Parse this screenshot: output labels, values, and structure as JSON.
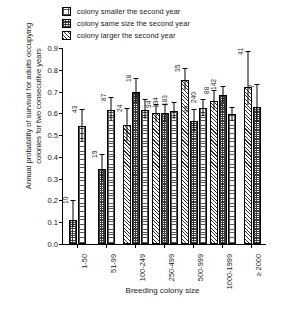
{
  "chart_data": {
    "type": "bar",
    "title": "",
    "xlabel": "Breeding colony size",
    "ylabel": "Annual probability of survival for adults occupying colonies for two consecutive years",
    "ylim": [
      0.0,
      0.9
    ],
    "yticks": [
      "0.0",
      "0.1",
      "0.2",
      "0.3",
      "0.4",
      "0.5",
      "0.6",
      "0.7",
      "0.8",
      "0.9"
    ],
    "categories": [
      "1-50",
      "51-99",
      "100-249",
      "250-499",
      "500-999",
      "1000-1999",
      "≥ 2000"
    ],
    "grid": false,
    "legend_position": "top",
    "series": [
      {
        "name": "colony smaller the second year",
        "pattern": "dots"
      },
      {
        "name": "colony same size the second year",
        "pattern": "dark"
      },
      {
        "name": "colony larger the second year",
        "pattern": "hatch"
      }
    ],
    "groups": [
      {
        "category": "1-50",
        "bars": [
          {
            "series": "colony same size the second year",
            "pattern": "dark",
            "value": 0.11,
            "err_low": 0.03,
            "err_high": 0.09,
            "n": "10"
          },
          {
            "series": "colony smaller the second year",
            "pattern": "dots",
            "value": 0.54,
            "err_low": 0.07,
            "err_high": 0.08,
            "n": "43"
          }
        ]
      },
      {
        "category": "51-99",
        "bars": [
          {
            "series": "colony same size the second year",
            "pattern": "dark",
            "value": 0.345,
            "err_low": 0.06,
            "err_high": 0.07,
            "n": "19"
          },
          {
            "series": "colony smaller the second year",
            "pattern": "dots",
            "value": 0.615,
            "err_low": 0.05,
            "err_high": 0.06,
            "n": "87"
          }
        ]
      },
      {
        "category": "100-249",
        "bars": [
          {
            "series": "colony larger the second year",
            "pattern": "hatch",
            "value": 0.545,
            "err_low": 0.07,
            "err_high": 0.08,
            "n": "24"
          },
          {
            "series": "colony same size the second year",
            "pattern": "dark",
            "value": 0.7,
            "err_low": 0.05,
            "err_high": 0.06,
            "n": "18"
          },
          {
            "series": "colony smaller the second year",
            "pattern": "dots",
            "value": 0.615,
            "err_low": 0.04,
            "err_high": 0.05,
            "n": "116"
          }
        ]
      },
      {
        "category": "250-499",
        "bars": [
          {
            "series": "colony larger the second year",
            "pattern": "hatch",
            "value": 0.6,
            "err_low": 0.04,
            "err_high": 0.045,
            "n": "94"
          },
          {
            "series": "colony same size the second year",
            "pattern": "dark",
            "value": 0.6,
            "err_low": 0.04,
            "err_high": 0.045,
            "n": "134"
          },
          {
            "series": "colony smaller the second year",
            "pattern": "dots",
            "value": 0.61,
            "err_low": 0.035,
            "err_high": 0.04,
            "n": "183"
          }
        ]
      },
      {
        "category": "500-999",
        "bars": [
          {
            "series": "colony larger the second year",
            "pattern": "hatch",
            "value": 0.755,
            "err_low": 0.05,
            "err_high": 0.055,
            "n": "35"
          },
          {
            "series": "colony same size the second year",
            "pattern": "dark",
            "value": 0.565,
            "err_low": 0.05,
            "err_high": 0.055,
            "n": "95"
          },
          {
            "series": "colony smaller the second year",
            "pattern": "dots",
            "value": 0.625,
            "err_low": 0.035,
            "err_high": 0.04,
            "n": "240"
          }
        ]
      },
      {
        "category": "1000-1999",
        "bars": [
          {
            "series": "colony larger the second year",
            "pattern": "hatch",
            "value": 0.655,
            "err_low": 0.04,
            "err_high": 0.05,
            "n": "88"
          },
          {
            "series": "colony same size the second year",
            "pattern": "dark",
            "value": 0.685,
            "err_low": 0.035,
            "err_high": 0.04,
            "n": "142"
          },
          {
            "series": "colony smaller the second year",
            "pattern": "dots",
            "value": 0.595,
            "err_low": 0.03,
            "err_high": 0.035,
            "n": "327"
          }
        ]
      },
      {
        "category": "≥ 2000",
        "bars": [
          {
            "series": "colony larger the second year",
            "pattern": "hatch",
            "value": 0.72,
            "err_low": 0.08,
            "err_high": 0.165,
            "n": "41"
          },
          {
            "series": "colony same size the second year",
            "pattern": "dark",
            "value": 0.63,
            "err_low": 0.07,
            "err_high": 0.105,
            "n": "7"
          }
        ]
      }
    ]
  },
  "legend": {
    "items": [
      {
        "label": "colony smaller the second year",
        "pattern": "dots"
      },
      {
        "label": "colony same size the second year",
        "pattern": "dark"
      },
      {
        "label": "colony larger the second year",
        "pattern": "hatch"
      }
    ]
  },
  "colors": {
    "ink": "#1a1a1a",
    "axis": "#000000",
    "background": "#ffffff"
  }
}
